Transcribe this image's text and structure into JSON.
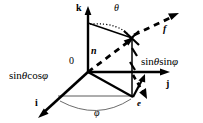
{
  "figure": {
    "colors": {
      "stroke": "#000000",
      "background": "#ffffff",
      "thin_stroke": "#555555"
    },
    "axes": [
      {
        "name": "k",
        "label": "k",
        "direction": "up"
      },
      {
        "name": "j",
        "label": "j",
        "direction": "right"
      },
      {
        "name": "i",
        "label": "i",
        "direction": "lower-left"
      }
    ],
    "origin_label": "0",
    "angles": [
      {
        "name": "theta",
        "label": "θ",
        "between": "k-axis and radial direction"
      },
      {
        "name": "phi",
        "label": "φ",
        "between": "i-axis and horizontal projection"
      }
    ],
    "vectors": [
      {
        "name": "n",
        "label": "n",
        "style": "dashed"
      },
      {
        "name": "f",
        "label": "f",
        "style": "dashed"
      },
      {
        "name": "e",
        "label": "e",
        "style": "solid"
      }
    ],
    "components": [
      {
        "name": "x-component",
        "label": "sin θ cos φ",
        "parts": [
          "sin",
          "θ",
          "cos",
          "φ"
        ]
      },
      {
        "name": "y-component",
        "label": "sin θ sin φ",
        "parts": [
          "sin",
          "θ",
          "sin",
          "φ"
        ]
      }
    ],
    "labels": {
      "k_axis": "k",
      "j_axis": "j",
      "i_axis": "i",
      "origin": "0",
      "theta": "θ",
      "phi": "φ",
      "n_vector": "n",
      "f_vector": "f",
      "e_vector": "e",
      "sin_theta_cos_phi_sin": "sin",
      "sin_theta_cos_phi_theta": "θ",
      "sin_theta_cos_phi_cos": "cos",
      "sin_theta_cos_phi_phi": "φ",
      "sin_theta_sin_phi_sin1": "sin",
      "sin_theta_sin_phi_theta": "θ",
      "sin_theta_sin_phi_sin2": "sin",
      "sin_theta_sin_phi_phi": "φ"
    }
  }
}
